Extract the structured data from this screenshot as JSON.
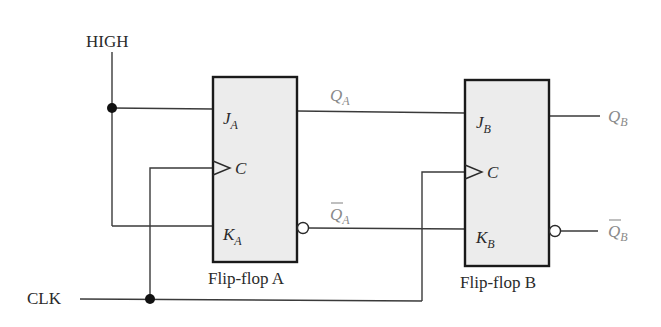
{
  "diagram": {
    "type": "JK flip-flop circuit",
    "inputs": {
      "high_label": "HIGH",
      "clk_label": "CLK"
    },
    "flip_flops": [
      {
        "name": "Flip-flop A",
        "pins": {
          "j": {
            "main": "J",
            "sub": "A"
          },
          "c": {
            "main": "C"
          },
          "k": {
            "main": "K",
            "sub": "A"
          }
        },
        "outputs": {
          "q": {
            "main": "Q",
            "sub": "A"
          },
          "qbar": {
            "main": "Q",
            "sub": "A",
            "overbar": true
          }
        }
      },
      {
        "name": "Flip-flop B",
        "pins": {
          "j": {
            "main": "J",
            "sub": "B"
          },
          "c": {
            "main": "C"
          },
          "k": {
            "main": "K",
            "sub": "B"
          }
        },
        "outputs": {
          "q": {
            "main": "Q",
            "sub": "B"
          },
          "qbar": {
            "main": "Q",
            "sub": "B",
            "overbar": true
          }
        }
      }
    ],
    "colors": {
      "wire": "#3a3a3a",
      "box_fill": "#ececec",
      "box_stroke": "#1a1a1a",
      "output_label": "#8a8a8a"
    }
  }
}
